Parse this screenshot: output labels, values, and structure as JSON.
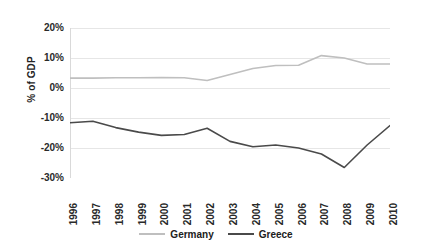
{
  "chart_data": {
    "type": "line",
    "title": "",
    "xlabel": "",
    "ylabel": "% of GDP",
    "categories": [
      "1996",
      "1997",
      "1998",
      "1999",
      "2000",
      "2001",
      "2002",
      "2003",
      "2004",
      "2005",
      "2006",
      "2007",
      "2008",
      "2009",
      "2010"
    ],
    "ylim": [
      -30,
      20
    ],
    "yticks": [
      20,
      10,
      0,
      -10,
      -20,
      -30
    ],
    "ytick_labels": [
      "20%",
      "10%",
      "0%",
      "-10%",
      "-20%",
      "-30%"
    ],
    "grid": true,
    "legend_position": "bottom",
    "series": [
      {
        "name": "Germany",
        "color": "#bfbfbf",
        "values": [
          3.3,
          3.3,
          3.4,
          3.4,
          3.5,
          3.4,
          2.5,
          4.5,
          6.5,
          7.5,
          7.6,
          10.8,
          10.0,
          8.0,
          8.0
        ]
      },
      {
        "name": "Greece",
        "color": "#4a4a4a",
        "values": [
          -11.6,
          -11.1,
          -13.2,
          -14.7,
          -15.8,
          -15.5,
          -13.4,
          -17.8,
          -19.6,
          -19.0,
          -20.0,
          -22.0,
          -26.5,
          -19.0,
          -12.5
        ]
      }
    ]
  },
  "legend": {
    "entries": [
      {
        "label": "Germany",
        "color": "#bfbfbf"
      },
      {
        "label": "Greece",
        "color": "#4a4a4a"
      }
    ]
  },
  "axes": {
    "y_title": "% of GDP",
    "axis_color": "#d9d9d9",
    "grid_color": "#e6e6e6"
  }
}
